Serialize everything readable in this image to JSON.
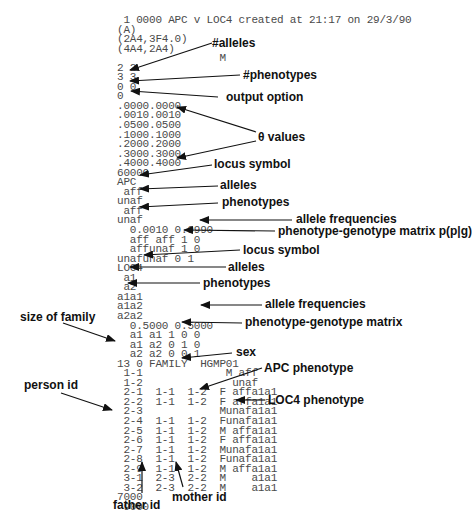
{
  "figure": {
    "file_lines": [
      " 1 0000 APC v LOC4 created at 21:17 on 29/3/90",
      "(A)",
      "(2A4,3F4.0)",
      "(4A4,2A4)",
      "                M",
      "2 2",
      "3 3",
      "0 0",
      "0",
      ".0000.0000",
      ".0010.0010",
      ".0500.0500",
      ".1000.1000",
      ".2000.2000",
      ".3000.3000",
      ".4000.4000",
      "60000",
      "APC",
      " aff",
      "unaf",
      " aff",
      "unaf",
      "  0.0010 0.9990",
      "  aff aff 1 0",
      "  affunaf 1 0",
      "unafunaf 0 1",
      "LOC4",
      " a1",
      " a2",
      "a1a1",
      "a1a2",
      "a2a2",
      "  0.5000 0.5000",
      "  a1 a1 1 0 0",
      "  a1 a2 0 1 0",
      "  a2 a2 0 0 1",
      "13 0 FAMILY  HGMP01",
      " 1-1             M aff",
      " 1-2              unaf",
      " 2-1  1-1  1-2  F affa1a1",
      " 2-2  1-1  1-2  F affa1a1",
      " 2-3            Munafa1a1",
      " 2-4  1-1  1-2  Funafa1a1",
      " 2-5  1-1  1-2  M affa1a1",
      " 2-6  1-1  1-2  F affa1a1",
      " 2-7  1-1  1-2  Munafa1a1",
      " 2-8  1-1  1-2  Funafa1a1",
      " 2-9  1-1  1-2  M affa1a1",
      " 3-1  2-3  2-2  M    a1a1",
      " 3-2  2-3  2-2  M    a1a1",
      "7000",
      " 9000"
    ],
    "annotations": {
      "alleles_count": "#alleles",
      "phenotypes_count": "#phenotypes",
      "output_option": "output option",
      "theta_values": "θ values",
      "locus_symbol_1": "locus symbol",
      "alleles_1": "alleles",
      "phenotypes_1": "phenotypes",
      "allele_frequencies_1": "allele frequencies",
      "pg_matrix_1": "phenotype-genotype matrix p(p|g)",
      "locus_symbol_2": "locus symbol",
      "alleles_2": "alleles",
      "phenotypes_2": "phenotypes",
      "allele_frequencies_2": "allele frequencies",
      "pg_matrix_2": "phenotype-genotype matrix",
      "size_of_family": "size of family",
      "sex": "sex",
      "apc_phenotype": "APC phenotype",
      "loc4_phenotype": "LOC4 phenotype",
      "person_id": "person id",
      "father_id": "father id",
      "mother_id": "mother id"
    }
  }
}
